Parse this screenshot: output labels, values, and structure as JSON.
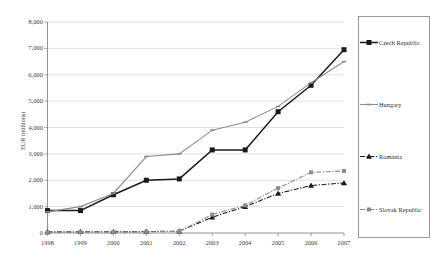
{
  "chart_data": {
    "type": "line",
    "title": "",
    "xlabel": "",
    "ylabel": "EUR (millions)",
    "x": [
      "1998",
      "1999",
      "2000",
      "2001",
      "2002",
      "2003",
      "2004",
      "2005",
      "2006",
      "2007"
    ],
    "categories": [
      "1998",
      "1999",
      "2000",
      "2001",
      "2002",
      "2003",
      "2004",
      "2005",
      "2006",
      "2007"
    ],
    "ylim": [
      0,
      8000
    ],
    "ytick_labels": [
      "0",
      "1,000",
      "2,000",
      "3,000",
      "4,000",
      "5,000",
      "6,000",
      "7,000",
      "8,000"
    ],
    "ytick_values": [
      0,
      1000,
      2000,
      3000,
      4000,
      5000,
      6000,
      7000,
      8000
    ],
    "grid": "horizontal",
    "legend_position": "right",
    "series": [
      {
        "name": "Czech Republic",
        "color": "#1a1a1a",
        "line_style": "solid",
        "marker": "square-filled",
        "values": [
          850,
          850,
          1450,
          2000,
          2050,
          3150,
          3150,
          4600,
          5600,
          6950
        ]
      },
      {
        "name": "Hungary",
        "color": "#8c8c8c",
        "line_style": "solid",
        "marker": "small-dash",
        "values": [
          800,
          1000,
          1500,
          2900,
          3000,
          3900,
          4200,
          4800,
          5700,
          6500
        ]
      },
      {
        "name": "Romania",
        "color": "#1a1a1a",
        "line_style": "dash-dot",
        "marker": "triangle-filled",
        "values": [
          40,
          45,
          50,
          55,
          70,
          600,
          1000,
          1500,
          1800,
          1900
        ]
      },
      {
        "name": "Slovak Republic",
        "color": "#8c8c8c",
        "line_style": "dash-dot",
        "marker": "square-small",
        "values": [
          30,
          35,
          40,
          45,
          60,
          700,
          1050,
          1700,
          2300,
          2350
        ]
      }
    ]
  },
  "legend": {
    "items": [
      {
        "label": "Czech Republic"
      },
      {
        "label": "Hungary"
      },
      {
        "label": "Romania"
      },
      {
        "label": "Slovak Republic"
      }
    ]
  }
}
